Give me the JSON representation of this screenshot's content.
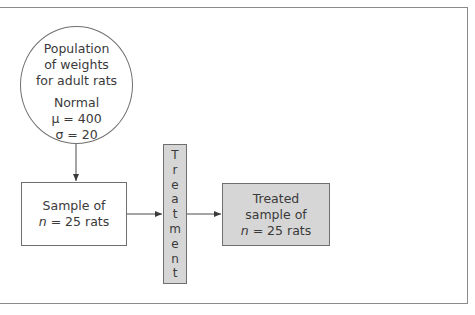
{
  "population": {
    "title_lines": [
      "Population",
      "of weights",
      "for adult rats"
    ],
    "distribution": "Normal",
    "mu": "μ = 400",
    "sigma": "σ = 20"
  },
  "sample": {
    "line1": "Sample of",
    "n_symbol": "n",
    "n_rest": " = 25 rats"
  },
  "treatment": {
    "label": "Treatment",
    "letters": [
      "T",
      "r",
      "e",
      "a",
      "t",
      "m",
      "e",
      "n",
      "t"
    ]
  },
  "treated_sample": {
    "line1": "Treated",
    "line2": "sample of",
    "n_symbol": "n",
    "n_rest": " = 25 rats"
  },
  "colors": {
    "box_fill_gray": "#d6d6d6",
    "stroke": "#6f6f6f"
  }
}
